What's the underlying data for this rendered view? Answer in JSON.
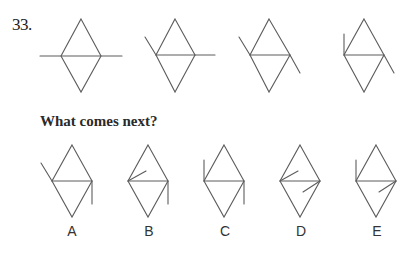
{
  "question": {
    "number": "33.",
    "prompt": "What comes next?"
  },
  "sequence": [
    {
      "id": "seq-1",
      "cx": 81,
      "cy": 56,
      "marks": [
        "horizontal-left-extension",
        "horizontal-right-extension"
      ]
    },
    {
      "id": "seq-2",
      "cx": 175,
      "cy": 55,
      "marks": [
        "diagonal-upper-left-extension",
        "horizontal-right-extension"
      ]
    },
    {
      "id": "seq-3",
      "cx": 269,
      "cy": 55,
      "marks": [
        "diagonal-upper-left-extension",
        "diagonal-lower-right-extension"
      ]
    },
    {
      "id": "seq-4",
      "cx": 364,
      "cy": 55,
      "marks": [
        "vertical-up-from-left",
        "diagonal-lower-right-extension"
      ]
    }
  ],
  "options": [
    {
      "label": "A",
      "cx": 72,
      "marks": [
        "diagonal-upper-left-extension",
        "vertical-down-from-right"
      ]
    },
    {
      "label": "B",
      "cx": 148,
      "marks": [
        "inner-tick-from-left",
        "vertical-down-from-right"
      ]
    },
    {
      "label": "C",
      "cx": 224,
      "marks": [
        "vertical-up-from-left",
        "vertical-down-from-right"
      ]
    },
    {
      "label": "D",
      "cx": 300,
      "marks": [
        "inner-tick-from-left",
        "inner-tick-from-right"
      ]
    },
    {
      "label": "E",
      "cx": 376,
      "marks": [
        "vertical-up-from-left",
        "inner-tick-from-right"
      ]
    }
  ],
  "colors": {
    "stroke": "#5c5c5c",
    "text": "#2a2a2a",
    "background": "#ffffff"
  }
}
